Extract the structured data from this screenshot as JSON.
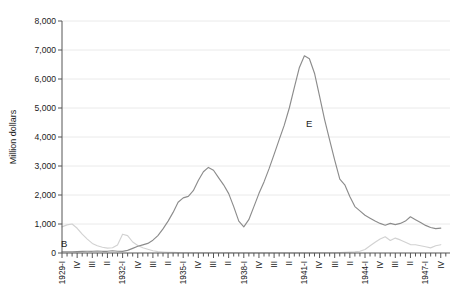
{
  "figure": {
    "background": "#ffffff",
    "y_axis_title": "Million dollars"
  },
  "chart_data": {
    "type": "line",
    "title": "",
    "xlabel": "",
    "ylabel": "Million dollars",
    "ylim": [
      0,
      8000
    ],
    "grid": "horizontal",
    "grid_color": "#e8e8e8",
    "axis_color": "#555555",
    "y_ticks": [
      0,
      1000,
      2000,
      3000,
      4000,
      5000,
      6000,
      7000,
      8000
    ],
    "y_tick_labels": [
      "0",
      "1,000",
      "2,000",
      "3,000",
      "4,000",
      "5,000",
      "6,000",
      "7,000",
      "8,000"
    ],
    "x_unit": "quarters",
    "x_range": [
      "1929-I",
      "1947-IV"
    ],
    "x_tick_label_every": 3,
    "x_tick_labels": [
      "1929-I",
      "IV",
      "III",
      "II",
      "1932-I",
      "IV",
      "III",
      "II",
      "1935-I",
      "IV",
      "III",
      "II",
      "1938-I",
      "IV",
      "III",
      "II",
      "1941-I",
      "IV",
      "III",
      "II",
      "1944-I",
      "IV",
      "III",
      "II",
      "1947-I",
      "IV"
    ],
    "series": [
      {
        "name": "E",
        "letter": "E",
        "color": "#8c8c8c",
        "values": [
          45,
          45,
          45,
          50,
          55,
          60,
          60,
          65,
          60,
          60,
          75,
          60,
          55,
          90,
          160,
          230,
          280,
          330,
          440,
          600,
          830,
          1100,
          1400,
          1750,
          1900,
          1950,
          2150,
          2500,
          2800,
          2950,
          2850,
          2600,
          2350,
          2050,
          1600,
          1100,
          900,
          1150,
          1600,
          2050,
          2450,
          2900,
          3400,
          3900,
          4400,
          5000,
          5700,
          6400,
          6800,
          6700,
          6200,
          5400,
          4600,
          3900,
          3200,
          2550,
          2350,
          1950,
          1600,
          1450,
          1300,
          1200,
          1100,
          1020,
          960,
          1020,
          980,
          1020,
          1100,
          1250,
          1150,
          1050,
          950,
          880,
          840,
          860
        ]
      },
      {
        "name": "B",
        "letter": "B",
        "color": "#d2d2d2",
        "values": [
          900,
          970,
          1000,
          850,
          650,
          480,
          330,
          250,
          200,
          170,
          180,
          280,
          650,
          600,
          380,
          260,
          180,
          130,
          80,
          50,
          35,
          25,
          20,
          15,
          12,
          10,
          10,
          10,
          10,
          10,
          10,
          10,
          12,
          15,
          12,
          10,
          8,
          8,
          8,
          8,
          8,
          8,
          8,
          8,
          8,
          8,
          8,
          8,
          8,
          8,
          8,
          10,
          10,
          10,
          12,
          15,
          20,
          30,
          40,
          60,
          120,
          250,
          370,
          480,
          560,
          430,
          515,
          450,
          370,
          290,
          285,
          250,
          215,
          175,
          250,
          285
        ]
      }
    ]
  }
}
